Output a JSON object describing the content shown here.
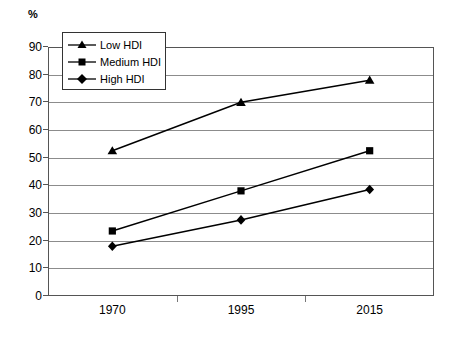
{
  "chart_data": {
    "type": "line",
    "title": "",
    "xlabel": "",
    "ylabel": "%",
    "categories": [
      "1970",
      "1995",
      "2015"
    ],
    "x": [
      1970,
      1995,
      2015
    ],
    "ylim": [
      0,
      90
    ],
    "yticks": [
      0,
      10,
      20,
      30,
      40,
      50,
      60,
      70,
      80,
      90
    ],
    "grid": "horizontal",
    "legend_position": "upper-left-inside",
    "series": [
      {
        "name": "Low HDI",
        "marker": "triangle",
        "values": [
          52.5,
          70,
          78
        ]
      },
      {
        "name": "Medium HDI",
        "marker": "square",
        "values": [
          23.5,
          38,
          52.5
        ]
      },
      {
        "name": "High HDI",
        "marker": "diamond",
        "values": [
          18,
          27.5,
          38.5
        ]
      }
    ],
    "line_color": "#000000",
    "grid_color": "#8c8c8c",
    "frame_color": "#555555"
  },
  "axis": {
    "unit_label": "%",
    "y_tick_labels": [
      "90",
      "80",
      "70",
      "60",
      "50",
      "40",
      "30",
      "20",
      "10",
      "0"
    ],
    "x_tick_labels": [
      "1970",
      "1995",
      "2015"
    ]
  },
  "legend": {
    "items": [
      {
        "label": "Low HDI",
        "marker": "triangle-marker"
      },
      {
        "label": "Medium HDI",
        "marker": "square-marker"
      },
      {
        "label": "High HDI",
        "marker": "diamond-marker"
      }
    ]
  }
}
